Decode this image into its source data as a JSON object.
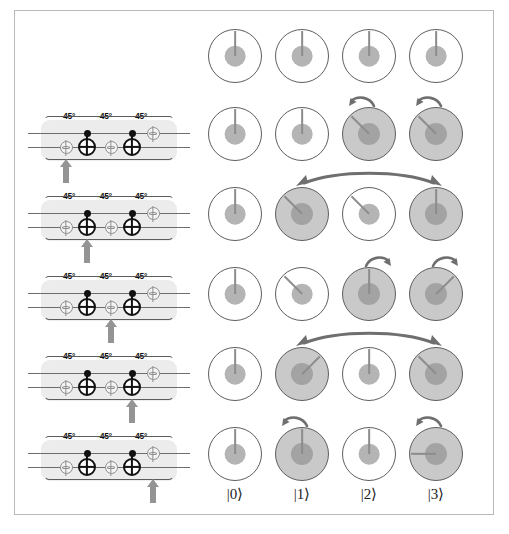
{
  "figure": {
    "caption": ""
  },
  "circuit": {
    "gate_labels": [
      "45°",
      "-45°",
      "45°"
    ],
    "panels": [
      {
        "step": 1,
        "highlight": "phase-gate-1"
      },
      {
        "step": 2,
        "highlight": "cnot-1"
      },
      {
        "step": 3,
        "highlight": "phase-gate-2"
      },
      {
        "step": 4,
        "highlight": "cnot-2"
      },
      {
        "step": 5,
        "highlight": "phase-gate-3"
      }
    ],
    "gates": [
      {
        "name": "phase-gate-1",
        "symbol": "φ",
        "wire": "bottom",
        "angle": "45°"
      },
      {
        "name": "cnot-1",
        "symbol": "⊕",
        "wire": "bottom",
        "control": "top"
      },
      {
        "name": "phase-gate-2",
        "symbol": "φ",
        "wire": "bottom",
        "angle": "-45°"
      },
      {
        "name": "cnot-2",
        "symbol": "⊕",
        "wire": "bottom",
        "control": "top"
      },
      {
        "name": "phase-gate-3",
        "symbol": "φ",
        "wire": "top",
        "angle": "45°"
      }
    ]
  },
  "states": {
    "labels": [
      "|0⟩",
      "|1⟩",
      "|2⟩",
      "|3⟩"
    ],
    "rows": [
      {
        "row": 0,
        "dials": [
          {
            "filled": false,
            "amplitude": 0.62,
            "phase_deg": 0
          },
          {
            "filled": false,
            "amplitude": 0.62,
            "phase_deg": 0
          },
          {
            "filled": false,
            "amplitude": 0.62,
            "phase_deg": 0
          },
          {
            "filled": false,
            "amplitude": 0.62,
            "phase_deg": 0
          }
        ],
        "annotations": []
      },
      {
        "row": 1,
        "dials": [
          {
            "filled": false,
            "amplitude": 0.62,
            "phase_deg": 0
          },
          {
            "filled": false,
            "amplitude": 0.62,
            "phase_deg": 0
          },
          {
            "filled": true,
            "amplitude": 0.66,
            "phase_deg": -45
          },
          {
            "filled": true,
            "amplitude": 0.66,
            "phase_deg": -45
          }
        ],
        "annotations": [
          {
            "type": "rotate-ccw",
            "column": 2
          },
          {
            "type": "rotate-ccw",
            "column": 3
          }
        ]
      },
      {
        "row": 2,
        "dials": [
          {
            "filled": false,
            "amplitude": 0.62,
            "phase_deg": 0
          },
          {
            "filled": true,
            "amplitude": 0.66,
            "phase_deg": -45
          },
          {
            "filled": false,
            "amplitude": 0.62,
            "phase_deg": -45
          },
          {
            "filled": true,
            "amplitude": 0.66,
            "phase_deg": 0
          }
        ],
        "annotations": [
          {
            "type": "swap",
            "from": 1,
            "to": 3
          }
        ]
      },
      {
        "row": 3,
        "dials": [
          {
            "filled": false,
            "amplitude": 0.62,
            "phase_deg": 0
          },
          {
            "filled": false,
            "amplitude": 0.62,
            "phase_deg": -45
          },
          {
            "filled": true,
            "amplitude": 0.66,
            "phase_deg": 0
          },
          {
            "filled": true,
            "amplitude": 0.66,
            "phase_deg": 45
          }
        ],
        "annotations": [
          {
            "type": "rotate-cw",
            "column": 2
          },
          {
            "type": "rotate-cw",
            "column": 3
          }
        ]
      },
      {
        "row": 4,
        "dials": [
          {
            "filled": false,
            "amplitude": 0.62,
            "phase_deg": 0
          },
          {
            "filled": true,
            "amplitude": 0.66,
            "phase_deg": 45
          },
          {
            "filled": false,
            "amplitude": 0.62,
            "phase_deg": 0
          },
          {
            "filled": true,
            "amplitude": 0.66,
            "phase_deg": -45
          }
        ],
        "annotations": [
          {
            "type": "swap",
            "from": 1,
            "to": 3
          }
        ]
      },
      {
        "row": 5,
        "dials": [
          {
            "filled": false,
            "amplitude": 0.62,
            "phase_deg": 0
          },
          {
            "filled": true,
            "amplitude": 0.66,
            "phase_deg": 0
          },
          {
            "filled": false,
            "amplitude": 0.62,
            "phase_deg": 0
          },
          {
            "filled": true,
            "amplitude": 0.66,
            "phase_deg": -90
          }
        ],
        "annotations": [
          {
            "type": "rotate-ccw",
            "column": 1
          },
          {
            "type": "rotate-ccw",
            "column": 3
          }
        ]
      }
    ]
  },
  "colors": {
    "arrow": "#6f6f6f",
    "step_arrow": "#949494",
    "panel_bg": "#ececec",
    "dial_fill": "#c9c9c9",
    "dial_inner": "#b4b4b4",
    "wire": "#6d6d6d"
  }
}
